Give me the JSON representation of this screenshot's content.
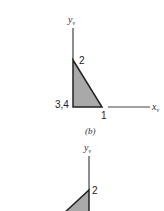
{
  "figure_b": {
    "caption": "(b)",
    "y_axis": {
      "label": "y",
      "subscript": "v"
    },
    "x_axis": {
      "label": "x",
      "subscript": "v"
    },
    "nodes": [
      {
        "id": "1",
        "label": "1"
      },
      {
        "id": "2",
        "label": "2"
      },
      {
        "id": "3,4",
        "label": "3,4"
      }
    ],
    "fill_color": "#a9a9a9",
    "stroke_color": "#222222"
  },
  "figure_c": {
    "y_axis": {
      "label": "y",
      "subscript": "v"
    },
    "nodes": [
      {
        "id": "2",
        "label": "2"
      }
    ],
    "fill_color": "#a9a9a9"
  }
}
